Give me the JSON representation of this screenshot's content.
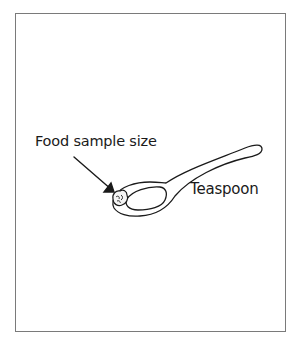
{
  "diagram": {
    "labels": {
      "food_sample": "Food sample size",
      "teaspoon": "Teaspoon"
    },
    "colors": {
      "stroke": "#1a1a1a",
      "frame": "#7a7a7a",
      "background": "#ffffff"
    }
  }
}
